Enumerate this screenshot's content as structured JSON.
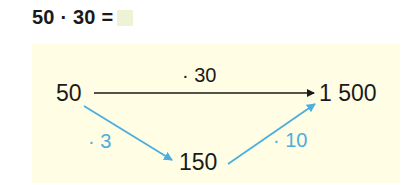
{
  "task": {
    "expression": "50 · 30 =",
    "answer_placeholder": ""
  },
  "diagram": {
    "nodes": {
      "start": "50",
      "middle": "150",
      "end": "1 500"
    },
    "operations": {
      "direct": "· 30",
      "step1": "· 3",
      "step2": "· 10"
    },
    "colors": {
      "direct_arrow": "#1a1a1a",
      "step_arrows": "#4aaede",
      "panel_background": "#fffde4",
      "answer_box": "#eef3d6"
    }
  }
}
